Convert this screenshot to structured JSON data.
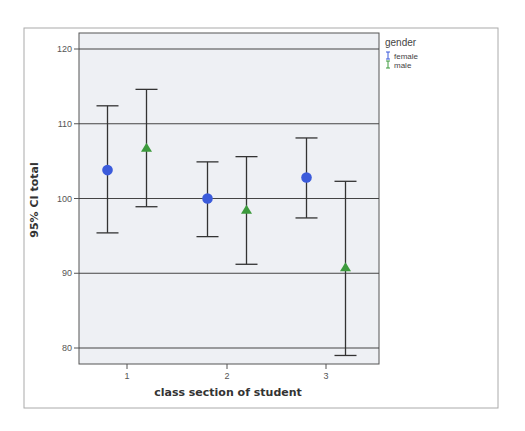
{
  "chart_data": {
    "type": "errorbar",
    "title": "",
    "xlabel": "class section of student",
    "ylabel": "95% CI total",
    "categories": [
      "1",
      "2",
      "3"
    ],
    "ylim": [
      78,
      122
    ],
    "yticks": [
      80,
      90,
      100,
      110,
      120
    ],
    "grid": "horizontal",
    "legend": {
      "title": "gender",
      "position": "right-top",
      "entries": [
        {
          "name": "female",
          "color": "#3b5bdb",
          "marker": "circle"
        },
        {
          "name": "male",
          "color": "#3c9a3c",
          "marker": "triangle"
        }
      ]
    },
    "series": [
      {
        "name": "female",
        "marker": "circle",
        "color": "#3b5bdb",
        "mean": [
          103.8,
          100.0,
          102.8
        ],
        "lower": [
          95.4,
          94.9,
          97.4
        ],
        "upper": [
          112.4,
          104.9,
          108.1
        ]
      },
      {
        "name": "male",
        "marker": "triangle",
        "color": "#3c9a3c",
        "mean": [
          106.8,
          98.5,
          90.8
        ],
        "lower": [
          98.9,
          91.2,
          79.0
        ],
        "upper": [
          114.6,
          105.6,
          102.3
        ]
      }
    ]
  },
  "colors": {
    "plot_background": "#eef0f4",
    "gridline": "#444444",
    "errorbar": "#333333",
    "frame": "#999999"
  }
}
